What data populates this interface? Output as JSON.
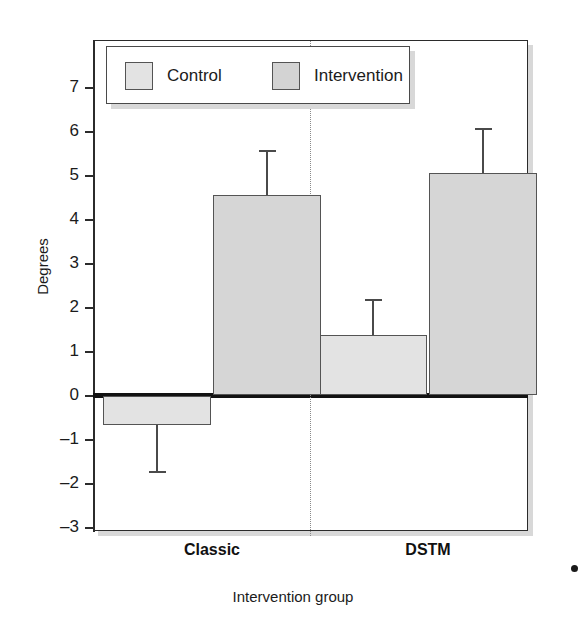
{
  "chart_data": {
    "type": "bar",
    "title": "",
    "xlabel": "Intervention group",
    "ylabel": "Degrees",
    "categories": [
      "Classic",
      "DSTM"
    ],
    "ylim": [
      -3,
      7
    ],
    "yticks": [
      7,
      6,
      5,
      4,
      3,
      2,
      1,
      0,
      -1,
      -2,
      -3
    ],
    "ytick_labels": [
      "7",
      "6",
      "5",
      "4",
      "3",
      "2",
      "1",
      "0",
      "–1",
      "–2",
      "–3"
    ],
    "grid": false,
    "legend_position": "upper-left-inside",
    "zero_line": true,
    "group_divider": true,
    "series": [
      {
        "name": "Control",
        "color": "#e3e3e3",
        "values": [
          -0.68,
          1.38
        ],
        "error_upper": [
          0.0,
          0.8
        ],
        "error_lower": [
          1.05,
          0.0
        ],
        "error_extent": [
          -1.73,
          2.18
        ]
      },
      {
        "name": "Intervention",
        "color": "#d6d6d6",
        "values": [
          4.55,
          5.05
        ],
        "error_upper": [
          1.0,
          1.0
        ],
        "error_lower": [
          0.0,
          0.0
        ],
        "error_extent": [
          5.55,
          6.05
        ]
      }
    ]
  },
  "legend": {
    "items": [
      {
        "label": "Control",
        "swatch_class": "control"
      },
      {
        "label": "Intervention",
        "swatch_class": "intervention"
      }
    ]
  },
  "axes": {
    "y_label": "Degrees",
    "x_label": "Intervention group",
    "y_tick_labels": [
      "7",
      "6",
      "5",
      "4",
      "3",
      "2",
      "1",
      "0",
      "–1",
      "–2",
      "–3"
    ],
    "x_tick_labels": [
      "Classic",
      "DSTM"
    ]
  },
  "colors": {
    "control_fill": "#e3e3e3",
    "intervention_fill": "#d6d6d6",
    "bar_stroke": "#545454",
    "axis": "#2b2b2b",
    "zero_line": "#121212",
    "error_bar": "#4a4a4a",
    "shadow": "#d8d8d8",
    "background": "#ffffff"
  }
}
